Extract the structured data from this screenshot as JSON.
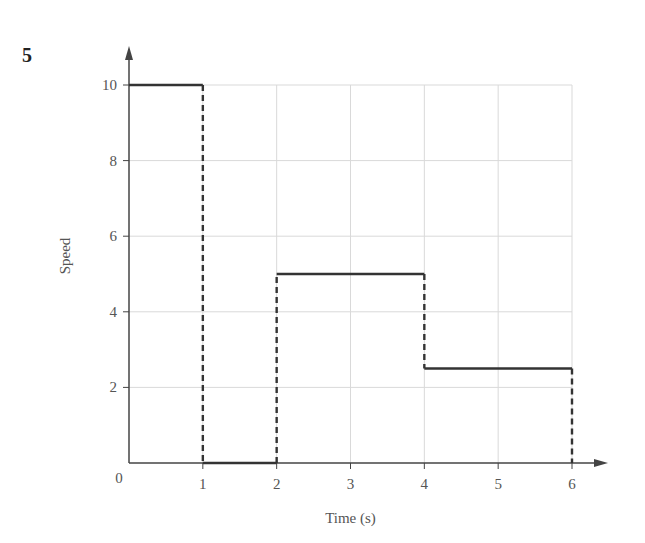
{
  "question_number": "5",
  "chart_data": {
    "type": "line",
    "subtype": "step",
    "title": "",
    "xlabel": "Time (s)",
    "ylabel": "Speed",
    "xlim": [
      0,
      6
    ],
    "ylim": [
      0,
      10
    ],
    "xticks": [
      1,
      2,
      3,
      4,
      5,
      6
    ],
    "yticks": [
      2,
      4,
      6,
      8,
      10
    ],
    "origin_label": "0",
    "grid": true,
    "legend": null,
    "segments": [
      {
        "x": [
          0,
          1
        ],
        "y": [
          10,
          10
        ],
        "style": "solid"
      },
      {
        "x": [
          1,
          1
        ],
        "y": [
          10,
          0
        ],
        "style": "dashed"
      },
      {
        "x": [
          1,
          2
        ],
        "y": [
          0,
          0
        ],
        "style": "solid"
      },
      {
        "x": [
          2,
          2
        ],
        "y": [
          0,
          5
        ],
        "style": "dashed"
      },
      {
        "x": [
          2,
          4
        ],
        "y": [
          5,
          5
        ],
        "style": "solid"
      },
      {
        "x": [
          4,
          4
        ],
        "y": [
          5,
          2.5
        ],
        "style": "dashed"
      },
      {
        "x": [
          4,
          6
        ],
        "y": [
          2.5,
          2.5
        ],
        "style": "solid"
      },
      {
        "x": [
          6,
          6
        ],
        "y": [
          2.5,
          0
        ],
        "style": "dashed"
      }
    ],
    "series": [
      {
        "name": "Speed",
        "x": [
          0,
          1,
          1,
          2,
          2,
          4,
          4,
          6,
          6
        ],
        "y": [
          10,
          10,
          0,
          0,
          5,
          5,
          2.5,
          2.5,
          0
        ]
      }
    ],
    "colors": {
      "line": "#333333",
      "grid": "#d9d9d9",
      "axis": "#444444"
    }
  }
}
